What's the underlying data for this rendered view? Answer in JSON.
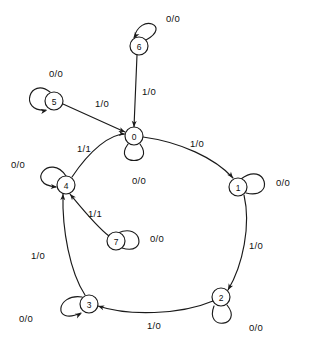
{
  "diagram": {
    "type": "state-transition-diagram",
    "title": "",
    "caption": "",
    "node_radius": 9,
    "stroke_color": "#1a1a1a",
    "background_color": "#ffffff",
    "edge_label_format": "input/output",
    "states": [
      {
        "id": "0",
        "label": "0",
        "cx": 134,
        "cy": 136
      },
      {
        "id": "1",
        "label": "1",
        "cx": 238,
        "cy": 187
      },
      {
        "id": "2",
        "label": "2",
        "cx": 221,
        "cy": 297
      },
      {
        "id": "3",
        "label": "3",
        "cx": 89,
        "cy": 304
      },
      {
        "id": "4",
        "label": "4",
        "cx": 66,
        "cy": 185
      },
      {
        "id": "5",
        "label": "5",
        "cx": 54,
        "cy": 101
      },
      {
        "id": "6",
        "label": "6",
        "cx": 139,
        "cy": 46
      },
      {
        "id": "7",
        "label": "7",
        "cx": 116,
        "cy": 241
      }
    ],
    "self_loops": [
      {
        "state": "0",
        "label": "0/0",
        "label_x": 139,
        "label_y": 180,
        "path": "M 128 144 C 112 166, 156 166, 140 144",
        "arrow": {
          "x": 128.5,
          "y": 144.5,
          "angle": 125
        }
      },
      {
        "state": "1",
        "label": "0/0",
        "label_x": 283,
        "label_y": 182,
        "path": "M 241 179 C 266 160, 276 200, 246 193",
        "arrow": {
          "x": 241.5,
          "y": 179.5,
          "angle": 320
        }
      },
      {
        "state": "2",
        "label": "0/0",
        "label_x": 256,
        "label_y": 327,
        "path": "M 227 305 C 244 326, 204 332, 214 306",
        "arrow": {
          "x": 226.5,
          "y": 304.5,
          "angle": 58
        }
      },
      {
        "state": "3",
        "label": "0/0",
        "label_x": 26,
        "label_y": 318,
        "path": "M 82 297 C 56 293, 52 326, 81 313",
        "arrow": {
          "x": 81.5,
          "y": 313.5,
          "angle": 335
        }
      },
      {
        "state": "4",
        "label": "0/0",
        "label_x": 18,
        "label_y": 164,
        "path": "M 66 176 C 50 152, 24 184, 56 187",
        "arrow": {
          "x": 57,
          "y": 187,
          "angle": 5
        }
      },
      {
        "state": "5",
        "label": "0/0",
        "label_x": 56,
        "label_y": 73,
        "path": "M 50 92 C 30 76, 18 112, 46 110",
        "arrow": {
          "x": 47,
          "y": 110.5,
          "angle": 350
        }
      },
      {
        "state": "6",
        "label": "0/0",
        "label_x": 173,
        "label_y": 18,
        "path": "M 134 38 C 140 12, 172 26, 146 40",
        "arrow": {
          "x": 134.5,
          "y": 38.5,
          "angle": 115
        }
      },
      {
        "state": "7",
        "label": "0/0",
        "label_x": 157,
        "label_y": 238,
        "path": "M 118 233 C 142 222, 148 256, 122 248",
        "arrow": {
          "x": 118.5,
          "y": 233.5,
          "angle": 330
        }
      }
    ],
    "transitions": [
      {
        "from": "6",
        "to": "0",
        "label": "1/0",
        "label_x": 149,
        "label_y": 91,
        "path": "M 137 55 L 134 127",
        "arrow": {
          "x": 134,
          "y": 127,
          "angle": 92
        }
      },
      {
        "from": "5",
        "to": "0",
        "label": "1/0",
        "label_x": 102,
        "label_y": 103,
        "path": "M 63 104 L 125 132",
        "arrow": {
          "x": 125,
          "y": 132,
          "angle": 24
        }
      },
      {
        "from": "4",
        "to": "0",
        "label": "1/1",
        "label_x": 84,
        "label_y": 148,
        "path": "M 72 177 C 90 150, 110 134, 125 134",
        "arrow": {
          "x": 125,
          "y": 134,
          "angle": 5
        }
      },
      {
        "from": "0",
        "to": "1",
        "label": "1/0",
        "label_x": 197,
        "label_y": 143,
        "path": "M 143 137 C 180 142, 215 158, 233 178",
        "arrow": {
          "x": 233,
          "y": 178,
          "angle": 50
        }
      },
      {
        "from": "1",
        "to": "2",
        "label": "1/0",
        "label_x": 256,
        "label_y": 245,
        "path": "M 244 195 C 251 225, 243 265, 228 290",
        "arrow": {
          "x": 228,
          "y": 290,
          "angle": 118
        }
      },
      {
        "from": "2",
        "to": "3",
        "label": "1/0",
        "label_x": 154,
        "label_y": 325,
        "path": "M 213 301 C 180 315, 128 316, 98 306",
        "arrow": {
          "x": 98,
          "y": 306,
          "angle": 198
        }
      },
      {
        "from": "3",
        "to": "4",
        "label": "1/0",
        "label_x": 38,
        "label_y": 255,
        "path": "M 85 295 C 70 272, 62 230, 63 194",
        "arrow": {
          "x": 63,
          "y": 194,
          "angle": 272
        }
      },
      {
        "from": "7",
        "to": "4",
        "label": "1/1",
        "label_x": 95,
        "label_y": 213,
        "path": "M 109 236 C 96 226, 80 206, 70 194",
        "arrow": {
          "x": 70,
          "y": 194,
          "angle": 230
        }
      }
    ]
  }
}
